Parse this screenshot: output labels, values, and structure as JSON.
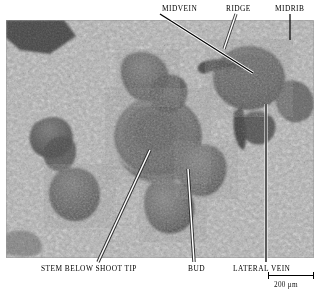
{
  "figure": {
    "type": "scanning-electron-micrograph",
    "background_color": "#ffffff",
    "image_tone": "#9a9a9a"
  },
  "micrograph": {
    "frame": {
      "x": 6,
      "y": 20,
      "width": 308,
      "height": 238
    },
    "description": "Grayscale SEM of a plant shoot apical meristem surrounded by leaf primordia, mottled epidermal cell texture"
  },
  "annotations": {
    "top": [
      {
        "id": "midvein",
        "label": "MIDVEIN",
        "x": 162,
        "y": 7,
        "leader": {
          "x1": 160,
          "y1": 14,
          "x2": 253,
          "y2": 73,
          "color": "#000000",
          "outline": "#ffffff"
        }
      },
      {
        "id": "ridge",
        "label": "RIDGE",
        "x": 226,
        "y": 7,
        "leader": {
          "x1": 236,
          "y1": 14,
          "x2": 224,
          "y2": 49,
          "color": "#ffffff",
          "outline": "#000000"
        }
      },
      {
        "id": "midrib",
        "label": "MIDRIB",
        "x": 275,
        "y": 7,
        "leader": {
          "x1": 290,
          "y1": 14,
          "x2": 290,
          "y2": 40,
          "color": "#000000",
          "outline": "#ffffff"
        }
      }
    ],
    "bottom": [
      {
        "id": "stem-below-shoot-tip",
        "label": "STEM BELOW SHOOT TIP",
        "x": 41,
        "y": 265,
        "leader": {
          "x1": 98,
          "y1": 262,
          "x2": 150,
          "y2": 150,
          "color": "#ffffff",
          "outline": "#000000"
        }
      },
      {
        "id": "bud",
        "label": "BUD",
        "x": 188,
        "y": 265,
        "leader": {
          "x1": 194,
          "y1": 262,
          "x2": 188,
          "y2": 169,
          "color": "#ffffff",
          "outline": "#000000"
        }
      },
      {
        "id": "lateral-vein",
        "label": "LATERAL VEIN",
        "x": 233,
        "y": 265,
        "leader": {
          "x1": 266,
          "y1": 262,
          "x2": 266,
          "y2": 107,
          "color": "#000000",
          "outline": "#ffffff"
        }
      }
    ]
  },
  "scale_bar": {
    "label": "200 μm",
    "length_px": 46,
    "position": {
      "x": 268,
      "y": 274
    }
  }
}
